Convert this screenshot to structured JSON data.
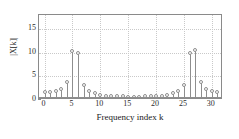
{
  "chart_data": {
    "type": "bar",
    "subtype": "stem",
    "title": "",
    "xlabel": "Frequency index k",
    "ylabel": "|X[k]|",
    "xlim": [
      -1,
      32
    ],
    "ylim": [
      0,
      18
    ],
    "xticks": [
      0,
      5,
      10,
      15,
      20,
      25,
      30
    ],
    "xtick_labels": [
      "0",
      "5",
      "10",
      "15",
      "20",
      "25",
      "30"
    ],
    "yticks": [
      0,
      5,
      10,
      15
    ],
    "ytick_labels": [
      "0",
      "5",
      "10",
      "15"
    ],
    "grid": true,
    "legend": null,
    "marker": "circle-open",
    "categories": [
      0,
      1,
      2,
      3,
      4,
      5,
      6,
      7,
      8,
      9,
      10,
      11,
      12,
      13,
      14,
      15,
      16,
      17,
      18,
      19,
      20,
      21,
      22,
      23,
      24,
      25,
      26,
      27,
      28,
      29,
      30,
      31
    ],
    "values": [
      1.75,
      1.8,
      1.95,
      2.3,
      3.75,
      10.4,
      9.9,
      3.2,
      2.0,
      1.4,
      1.1,
      0.95,
      0.85,
      0.8,
      0.75,
      0.7,
      0.7,
      0.7,
      0.75,
      0.8,
      0.85,
      0.95,
      1.1,
      1.4,
      2.0,
      3.25,
      9.9,
      10.5,
      3.8,
      2.4,
      2.0,
      1.8
    ]
  },
  "axes": {
    "ylabel_text": "|X[k]|",
    "xlabel_text": "Frequency index k"
  }
}
